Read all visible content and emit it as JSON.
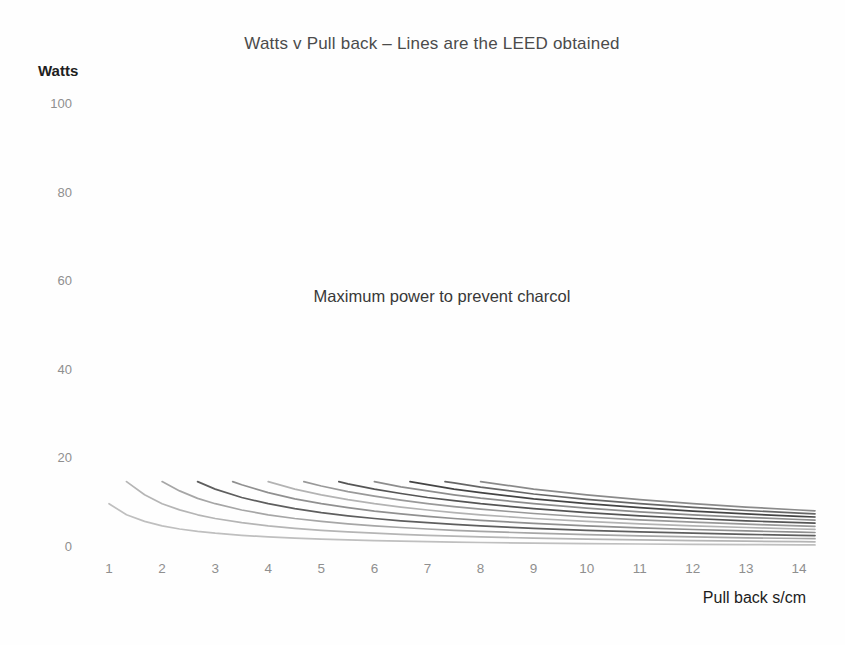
{
  "chart_data": {
    "type": "line",
    "title": "Watts v Pull back – Lines are the LEED obtained",
    "y_axis_title": "Watts",
    "x_axis_title": "Pull back s/cm",
    "annotation": "Maximum power to prevent charcol",
    "x_ticks": [
      1,
      2,
      3,
      4,
      5,
      6,
      7,
      8,
      9,
      10,
      11,
      12,
      13,
      14
    ],
    "y_ticks": [
      0,
      20,
      40,
      60,
      80,
      100
    ],
    "x_range": [
      1,
      14.3
    ],
    "y_range": [
      0,
      105
    ],
    "grid": false,
    "legend_position": "none",
    "max_power_start_watts": 15,
    "series": [
      {
        "name": "line-01",
        "color": "#bfbfbf",
        "points": [
          [
            1,
            10
          ],
          [
            1.33,
            7.5
          ],
          [
            1.67,
            6
          ],
          [
            2,
            5
          ],
          [
            2.33,
            4.3
          ],
          [
            2.67,
            3.75
          ],
          [
            3,
            3.33
          ],
          [
            3.5,
            2.86
          ],
          [
            4,
            2.5
          ],
          [
            4.5,
            2.22
          ],
          [
            5,
            2
          ],
          [
            5.5,
            1.82
          ],
          [
            6,
            1.67
          ],
          [
            6.5,
            1.54
          ],
          [
            7,
            1.43
          ],
          [
            7.5,
            1.33
          ],
          [
            8,
            1.25
          ],
          [
            9,
            1.11
          ],
          [
            10,
            1
          ],
          [
            11,
            0.91
          ],
          [
            12,
            0.83
          ],
          [
            13,
            0.77
          ],
          [
            14,
            0.71
          ],
          [
            14.3,
            0.7
          ]
        ]
      },
      {
        "name": "line-02",
        "color": "#b5b5b5",
        "points": [
          [
            1.33,
            15
          ],
          [
            1.67,
            12
          ],
          [
            2,
            10
          ],
          [
            2.33,
            8.6
          ],
          [
            2.67,
            7.5
          ],
          [
            3,
            6.67
          ],
          [
            3.5,
            5.71
          ],
          [
            4,
            5
          ],
          [
            4.5,
            4.44
          ],
          [
            5,
            4
          ],
          [
            5.5,
            3.64
          ],
          [
            6,
            3.33
          ],
          [
            6.5,
            3.08
          ],
          [
            7,
            2.86
          ],
          [
            7.5,
            2.67
          ],
          [
            8,
            2.5
          ],
          [
            9,
            2.22
          ],
          [
            10,
            2
          ],
          [
            11,
            1.82
          ],
          [
            12,
            1.67
          ],
          [
            13,
            1.54
          ],
          [
            14,
            1.43
          ],
          [
            14.3,
            1.4
          ]
        ]
      },
      {
        "name": "line-03",
        "color": "#a6a6a6",
        "points": [
          [
            2,
            15
          ],
          [
            2.33,
            12.9
          ],
          [
            2.67,
            11.2
          ],
          [
            3,
            10
          ],
          [
            3.5,
            8.57
          ],
          [
            4,
            7.5
          ],
          [
            4.5,
            6.67
          ],
          [
            5,
            6
          ],
          [
            5.5,
            5.45
          ],
          [
            6,
            5
          ],
          [
            6.5,
            4.62
          ],
          [
            7,
            4.29
          ],
          [
            7.5,
            4
          ],
          [
            8,
            3.75
          ],
          [
            9,
            3.33
          ],
          [
            10,
            3
          ],
          [
            11,
            2.73
          ],
          [
            12,
            2.5
          ],
          [
            13,
            2.31
          ],
          [
            14,
            2.14
          ],
          [
            14.3,
            2.1
          ]
        ]
      },
      {
        "name": "line-04",
        "color": "#5e5e5e",
        "points": [
          [
            2.67,
            15
          ],
          [
            3,
            13.3
          ],
          [
            3.5,
            11.4
          ],
          [
            4,
            10
          ],
          [
            4.5,
            8.89
          ],
          [
            5,
            8
          ],
          [
            5.5,
            7.27
          ],
          [
            6,
            6.67
          ],
          [
            6.5,
            6.15
          ],
          [
            7,
            5.71
          ],
          [
            7.5,
            5.33
          ],
          [
            8,
            5
          ],
          [
            9,
            4.44
          ],
          [
            10,
            4
          ],
          [
            11,
            3.64
          ],
          [
            12,
            3.33
          ],
          [
            13,
            3.08
          ],
          [
            14,
            2.86
          ],
          [
            14.3,
            2.8
          ]
        ]
      },
      {
        "name": "line-05",
        "color": "#909090",
        "points": [
          [
            3.33,
            15
          ],
          [
            3.5,
            14.3
          ],
          [
            4,
            12.5
          ],
          [
            4.5,
            11.1
          ],
          [
            5,
            10
          ],
          [
            5.5,
            9.09
          ],
          [
            6,
            8.33
          ],
          [
            6.5,
            7.69
          ],
          [
            7,
            7.14
          ],
          [
            7.5,
            6.67
          ],
          [
            8,
            6.25
          ],
          [
            9,
            5.56
          ],
          [
            10,
            5
          ],
          [
            11,
            4.55
          ],
          [
            12,
            4.17
          ],
          [
            13,
            3.85
          ],
          [
            14,
            3.57
          ],
          [
            14.3,
            3.5
          ]
        ]
      },
      {
        "name": "line-06",
        "color": "#b3b3b3",
        "points": [
          [
            4,
            15
          ],
          [
            4.5,
            13.3
          ],
          [
            5,
            12
          ],
          [
            5.5,
            10.9
          ],
          [
            6,
            10
          ],
          [
            6.5,
            9.23
          ],
          [
            7,
            8.57
          ],
          [
            7.5,
            8
          ],
          [
            8,
            7.5
          ],
          [
            9,
            6.67
          ],
          [
            10,
            6
          ],
          [
            11,
            5.45
          ],
          [
            12,
            5
          ],
          [
            13,
            4.62
          ],
          [
            14,
            4.29
          ],
          [
            14.3,
            4.2
          ]
        ]
      },
      {
        "name": "line-07",
        "color": "#999999",
        "points": [
          [
            4.67,
            15
          ],
          [
            5,
            14
          ],
          [
            5.5,
            12.7
          ],
          [
            6,
            11.7
          ],
          [
            6.5,
            10.8
          ],
          [
            7,
            10
          ],
          [
            7.5,
            9.33
          ],
          [
            8,
            8.75
          ],
          [
            9,
            7.78
          ],
          [
            10,
            7
          ],
          [
            11,
            6.36
          ],
          [
            12,
            5.83
          ],
          [
            13,
            5.38
          ],
          [
            14,
            5
          ],
          [
            14.3,
            4.9
          ]
        ]
      },
      {
        "name": "line-08",
        "color": "#555555",
        "points": [
          [
            5.33,
            15
          ],
          [
            5.5,
            14.5
          ],
          [
            6,
            13.3
          ],
          [
            6.5,
            12.3
          ],
          [
            7,
            11.4
          ],
          [
            7.5,
            10.7
          ],
          [
            8,
            10
          ],
          [
            9,
            8.89
          ],
          [
            10,
            8
          ],
          [
            11,
            7.27
          ],
          [
            12,
            6.67
          ],
          [
            13,
            6.15
          ],
          [
            14,
            5.71
          ],
          [
            14.3,
            5.6
          ]
        ]
      },
      {
        "name": "line-09",
        "color": "#8d8d8d",
        "points": [
          [
            6,
            15
          ],
          [
            6.5,
            13.8
          ],
          [
            7,
            12.9
          ],
          [
            7.5,
            12
          ],
          [
            8,
            11.25
          ],
          [
            9,
            10
          ],
          [
            10,
            9
          ],
          [
            11,
            8.18
          ],
          [
            12,
            7.5
          ],
          [
            13,
            6.92
          ],
          [
            14,
            6.43
          ],
          [
            14.3,
            6.29
          ]
        ]
      },
      {
        "name": "line-10",
        "color": "#444444",
        "points": [
          [
            6.67,
            15
          ],
          [
            7,
            14.3
          ],
          [
            7.5,
            13.3
          ],
          [
            8,
            12.5
          ],
          [
            9,
            11.1
          ],
          [
            10,
            10
          ],
          [
            11,
            9.09
          ],
          [
            12,
            8.33
          ],
          [
            13,
            7.69
          ],
          [
            14,
            7.14
          ],
          [
            14.3,
            6.99
          ]
        ]
      },
      {
        "name": "line-11",
        "color": "#666666",
        "points": [
          [
            7.33,
            15
          ],
          [
            7.5,
            14.7
          ],
          [
            8,
            13.75
          ],
          [
            9,
            12.2
          ],
          [
            10,
            11
          ],
          [
            11,
            10
          ],
          [
            12,
            9.17
          ],
          [
            13,
            8.46
          ],
          [
            14,
            7.86
          ],
          [
            14.3,
            7.69
          ]
        ]
      },
      {
        "name": "line-12",
        "color": "#8a8a8a",
        "points": [
          [
            8,
            15
          ],
          [
            9,
            13.3
          ],
          [
            10,
            12
          ],
          [
            11,
            10.9
          ],
          [
            12,
            10
          ],
          [
            13,
            9.23
          ],
          [
            14,
            8.57
          ],
          [
            14.3,
            8.39
          ]
        ]
      }
    ],
    "colors": {
      "title_text": "#4b4b4b",
      "axis_tick_text": "#8f8f8f",
      "axis_title_text": "#1c1c1c",
      "annotation_text": "#383838",
      "background": "#fefefe"
    }
  }
}
